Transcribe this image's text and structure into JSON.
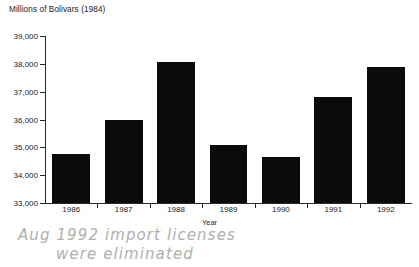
{
  "chart_data": {
    "type": "bar",
    "title": "Millions of Bolivars (1984)",
    "xlabel": "Year",
    "ylabel": "",
    "categories": [
      "1986",
      "1987",
      "1988",
      "1989",
      "1990",
      "1991",
      "1992"
    ],
    "values": [
      34750,
      36000,
      38050,
      35080,
      34650,
      36800,
      37900
    ],
    "ylim": [
      33000,
      39000
    ],
    "y_ticks": [
      33000,
      34000,
      35000,
      36000,
      37000,
      38000,
      39000
    ],
    "y_tick_labels": [
      "33,000",
      "34,000",
      "35,000",
      "36,000",
      "37,000",
      "38,000",
      "39,000"
    ],
    "grid": false,
    "legend": null,
    "bar_color": "#0b0b0b",
    "axis_color": "#2a2a2a",
    "background_color": "#ffffff",
    "annotations": [
      {
        "name": "handwritten-note",
        "line1": "Aug 1992 import licenses",
        "line2": "were eliminated",
        "color": "#a9a9a9"
      }
    ]
  },
  "chart": {
    "title": "Millions of Bolivars (1984)",
    "xlabel": "Year"
  },
  "annotation": {
    "line1": "Aug 1992 import licenses",
    "line2": "were eliminated"
  }
}
